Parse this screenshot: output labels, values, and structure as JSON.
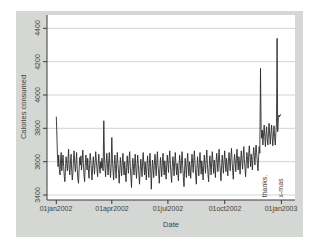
{
  "figure": {
    "colors": {
      "page-bg": "#ffffff",
      "panel-bg": "#d5d7d4",
      "plot-bg": "#ffffff",
      "grid": "#c9d0ca",
      "axis": "#3a3a3a",
      "series": "#2b2b2b",
      "text": "#3f3f3f"
    }
  },
  "chart_data": {
    "type": "line",
    "title": "",
    "xlabel": "Date",
    "ylabel": "Calories consumed",
    "grid": "horizontal",
    "legend": "none",
    "x_tick_labels": [
      "01jan2002",
      "01apr2002",
      "01jul2002",
      "01oct2002",
      "01jan2003"
    ],
    "x_tick_days": [
      0,
      90,
      181,
      273,
      365
    ],
    "y_ticks": [
      3400,
      3600,
      3800,
      4000,
      4200,
      4400
    ],
    "ylim": [
      3370,
      4480
    ],
    "xlim_days": [
      -15,
      387
    ],
    "annotations": [
      {
        "text": "thanks.",
        "day": 336,
        "event": "thanksgiving-spike"
      },
      {
        "text": "x-mas",
        "day": 363,
        "event": "christmas-spike"
      }
    ],
    "series": [
      {
        "name": "Calories consumed",
        "x_start": "01jan2002",
        "frequency": "daily",
        "values": [
          3870,
          3760,
          3620,
          3570,
          3640,
          3560,
          3520,
          3610,
          3655,
          3545,
          3590,
          3640,
          3570,
          3510,
          3480,
          3560,
          3630,
          3590,
          3545,
          3615,
          3675,
          3560,
          3520,
          3585,
          3645,
          3550,
          3490,
          3530,
          3620,
          3665,
          3580,
          3540,
          3600,
          3655,
          3560,
          3500,
          3470,
          3555,
          3625,
          3580,
          3635,
          3550,
          3610,
          3670,
          3590,
          3520,
          3480,
          3570,
          3640,
          3595,
          3550,
          3620,
          3560,
          3500,
          3585,
          3650,
          3605,
          3545,
          3490,
          3575,
          3630,
          3580,
          3525,
          3595,
          3660,
          3600,
          3555,
          3510,
          3590,
          3645,
          3575,
          3530,
          3600,
          3560,
          3620,
          3580,
          3545,
          3845,
          3640,
          3560,
          3510,
          3590,
          3650,
          3575,
          3520,
          3600,
          3655,
          3565,
          3505,
          3580,
          3745,
          3620,
          3550,
          3490,
          3575,
          3640,
          3560,
          3500,
          3585,
          3655,
          3590,
          3530,
          3470,
          3555,
          3625,
          3570,
          3515,
          3595,
          3650,
          3575,
          3520,
          3600,
          3545,
          3480,
          3565,
          3635,
          3585,
          3530,
          3610,
          3660,
          3570,
          3505,
          3445,
          3550,
          3620,
          3575,
          3520,
          3590,
          3645,
          3560,
          3500,
          3580,
          3640,
          3585,
          3525,
          3465,
          3555,
          3615,
          3570,
          3510,
          3595,
          3655,
          3580,
          3520,
          3600,
          3550,
          3490,
          3575,
          3635,
          3565,
          3505,
          3590,
          3650,
          3570,
          3435,
          3540,
          3610,
          3560,
          3505,
          3585,
          3645,
          3575,
          3515,
          3600,
          3660,
          3580,
          3525,
          3470,
          3560,
          3625,
          3570,
          3510,
          3595,
          3650,
          3575,
          3520,
          3605,
          3555,
          3495,
          3580,
          3640,
          3590,
          3535,
          3615,
          3665,
          3585,
          3525,
          3475,
          3565,
          3630,
          3575,
          3515,
          3600,
          3655,
          3580,
          3520,
          3590,
          3545,
          3485,
          3570,
          3640,
          3585,
          3530,
          3605,
          3660,
          3575,
          3510,
          3450,
          3555,
          3620,
          3565,
          3505,
          3590,
          3650,
          3570,
          3515,
          3600,
          3560,
          3500,
          3585,
          3645,
          3590,
          3535,
          3610,
          3665,
          3580,
          3520,
          3465,
          3560,
          3630,
          3575,
          3515,
          3595,
          3655,
          3585,
          3525,
          3605,
          3550,
          3490,
          3575,
          3640,
          3590,
          3530,
          3615,
          3670,
          3585,
          3525,
          3480,
          3570,
          3635,
          3580,
          3520,
          3600,
          3660,
          3590,
          3530,
          3610,
          3565,
          3505,
          3590,
          3650,
          3595,
          3540,
          3620,
          3675,
          3595,
          3535,
          3485,
          3575,
          3640,
          3590,
          3530,
          3610,
          3665,
          3595,
          3540,
          3620,
          3575,
          3515,
          3600,
          3655,
          3600,
          3545,
          3625,
          3680,
          3600,
          3545,
          3495,
          3585,
          3645,
          3600,
          3540,
          3620,
          3675,
          3605,
          3550,
          3630,
          3585,
          3525,
          3610,
          3665,
          3610,
          3555,
          3635,
          3690,
          3615,
          3560,
          3510,
          3600,
          3655,
          3615,
          3560,
          3640,
          3695,
          3625,
          3570,
          3645,
          3605,
          3550,
          3630,
          3685,
          3635,
          3580,
          3655,
          3700,
          3640,
          3590,
          3545,
          3630,
          3690,
          3650,
          4160,
          3800,
          3740,
          3790,
          3700,
          3760,
          3820,
          3750,
          3690,
          3770,
          3810,
          3740,
          3700,
          3780,
          3830,
          3760,
          3705,
          3770,
          3820,
          3745,
          3695,
          3760,
          3815,
          3750,
          3700,
          3775,
          3830,
          4340,
          3780,
          3860,
          3880,
          3870,
          3880,
          3885
        ]
      }
    ]
  }
}
